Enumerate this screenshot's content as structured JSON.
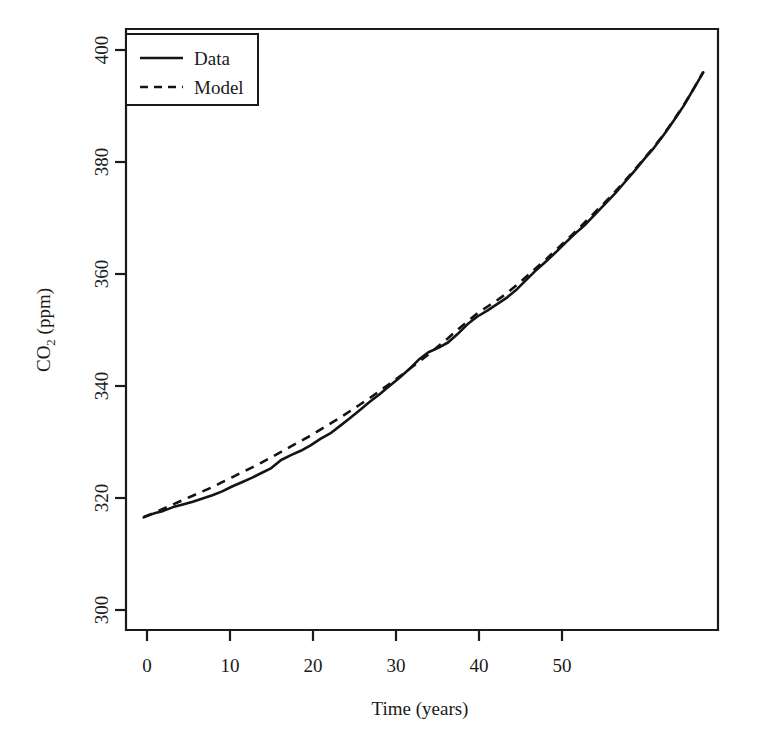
{
  "chart_data": {
    "type": "line",
    "title": "",
    "xlabel": "Time (years)",
    "ylabel_prefix": "CO",
    "ylabel_sub": "2",
    "ylabel_suffix": " (ppm)",
    "ylabel": "CO2 (ppm)",
    "xlim": [
      -1.8,
      58.5
    ],
    "ylim": [
      295.5,
      406.5
    ],
    "xticks": [
      0,
      10,
      20,
      30,
      40,
      50
    ],
    "yticks": [
      300,
      320,
      340,
      360,
      380,
      400
    ],
    "xtick_labels": [
      "0",
      "10",
      "20",
      "30",
      "40",
      "50"
    ],
    "ytick_labels": [
      "300",
      "320",
      "340",
      "360",
      "380",
      "400"
    ],
    "grid": false,
    "legend_position": "top-left",
    "legend_entries": [
      {
        "label": "Data",
        "style": "solid"
      },
      {
        "label": "Model",
        "style": "dashed"
      }
    ],
    "line_color": "#141414",
    "series": [
      {
        "name": "Data",
        "style": "solid",
        "x": [
          0,
          1,
          2,
          3,
          4,
          5,
          6,
          7,
          8,
          9,
          10,
          11,
          12,
          13,
          14,
          15,
          16,
          17,
          18,
          19,
          20,
          21,
          22,
          23,
          24,
          25,
          26,
          27,
          28,
          29,
          30,
          31,
          32,
          33,
          34,
          35,
          36,
          37,
          38,
          39,
          40,
          41,
          42,
          43,
          44,
          45,
          46,
          47,
          48,
          49,
          50,
          51,
          52,
          53,
          54,
          55,
          56,
          57
        ],
        "values": [
          316.3,
          317.0,
          317.5,
          318.2,
          318.7,
          319.2,
          319.8,
          320.4,
          321.1,
          322.0,
          322.8,
          323.6,
          324.5,
          325.4,
          326.9,
          327.8,
          328.6,
          329.6,
          330.8,
          331.8,
          333.2,
          334.6,
          336.1,
          337.6,
          339.0,
          340.5,
          342.0,
          343.6,
          345.4,
          346.8,
          347.6,
          348.6,
          350.2,
          352.0,
          353.4,
          354.5,
          355.7,
          356.9,
          358.4,
          360.2,
          362.0,
          363.6,
          365.3,
          367.1,
          368.8,
          370.4,
          372.3,
          374.2,
          376.1,
          378.2,
          380.3,
          382.5,
          384.6,
          387.0,
          389.6,
          392.3,
          395.4,
          398.5
        ],
        "values_note": "Annual mean CO2 in ppm, reading from the solid curve"
      },
      {
        "name": "Model",
        "style": "dashed",
        "x": [
          0,
          1,
          2,
          3,
          4,
          5,
          6,
          7,
          8,
          9,
          10,
          11,
          12,
          13,
          14,
          15,
          16,
          17,
          18,
          19,
          20,
          21,
          22,
          23,
          24,
          25,
          26,
          27,
          28,
          29,
          30,
          31,
          32,
          33,
          34,
          35,
          36,
          37,
          38,
          39,
          40,
          41,
          42,
          43,
          44,
          45,
          46,
          47,
          48,
          49,
          50,
          51,
          52,
          53,
          54,
          55,
          56,
          57
        ],
        "values": [
          316.4,
          317.1,
          317.9,
          318.7,
          319.5,
          320.3,
          321.1,
          321.9,
          322.8,
          323.7,
          324.6,
          325.5,
          326.4,
          327.4,
          328.4,
          329.4,
          330.4,
          331.4,
          332.5,
          333.6,
          334.7,
          335.9,
          337.1,
          338.3,
          339.6,
          340.9,
          342.2,
          343.6,
          345.0,
          346.4,
          347.9,
          349.4,
          351.0,
          352.5,
          354.0,
          355.2,
          356.4,
          357.7,
          359.2,
          360.8,
          362.4,
          364.0,
          365.7,
          367.4,
          369.1,
          370.9,
          372.7,
          374.5,
          376.4,
          378.4,
          380.5,
          382.6,
          384.8,
          387.1,
          389.7,
          392.4,
          395.4,
          398.6
        ],
        "values_note": "Smooth fitted model curve in ppm"
      }
    ]
  }
}
